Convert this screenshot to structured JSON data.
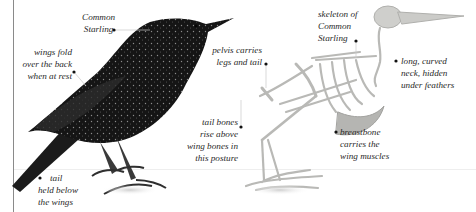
{
  "figure": {
    "colors": {
      "background": "#ffffff",
      "bird_plumage": "#141414",
      "plumage_speckle": "#9a9a9a",
      "skeleton_bone": "#c9c9c7",
      "skeleton_shadow": "#a8a8a6",
      "label_text": "#2a2a2a",
      "left_rule": "#8a8a8a"
    }
  },
  "labels": {
    "common_starling": {
      "lines": [
        "Common",
        "Starling"
      ]
    },
    "wings_fold": {
      "lines": [
        "wings fold",
        "over the back",
        "when at rest"
      ]
    },
    "tail_held": {
      "lines": [
        "tail",
        "held below",
        "the wings"
      ]
    },
    "pelvis": {
      "lines": [
        "pelvis carries",
        "legs and tail"
      ]
    },
    "tail_bones": {
      "lines": [
        "tail bones",
        "rise above",
        "wing bones in",
        "this posture"
      ]
    },
    "skeleton": {
      "lines": [
        "skeleton of",
        "Common",
        "Starling"
      ]
    },
    "neck": {
      "lines": [
        "long, curved",
        "neck, hidden",
        "under feathers"
      ]
    },
    "breastbone": {
      "lines": [
        "breastbone",
        "carries the",
        "wing muscles"
      ]
    }
  }
}
